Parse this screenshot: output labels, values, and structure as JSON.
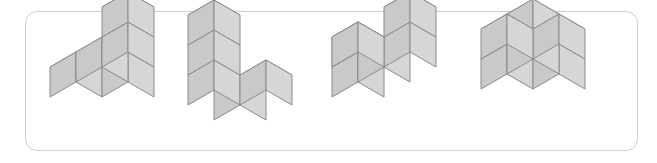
{
  "panel": {
    "border_color": "#cfcfcf",
    "background": "#ffffff",
    "corner_radius": 12,
    "width": 613,
    "height": 140
  },
  "render": {
    "cube_size": 30,
    "iso_dx": 26,
    "iso_dy": 15,
    "top_face_color": "#e2e2e2",
    "left_face_color": "#c9c9c9",
    "right_face_color": "#d6d6d6",
    "edge_color": "#8a8a8a",
    "edge_width": 1
  },
  "figures": [
    {
      "id": "figure-1",
      "label": "cube-figure-1",
      "left": 30,
      "top": 0,
      "origin_x": 20,
      "origin_y": 100,
      "cubes": [
        [
          0,
          0,
          0
        ],
        [
          1,
          0,
          0
        ],
        [
          2,
          0,
          0
        ],
        [
          1,
          -1,
          0
        ],
        [
          2,
          0,
          1
        ]
      ]
    },
    {
      "id": "figure-2",
      "label": "cube-figure-2",
      "left": 168,
      "top": 0,
      "origin_x": 20,
      "origin_y": 108,
      "cubes": [
        [
          0,
          0,
          0
        ],
        [
          0,
          0,
          1
        ],
        [
          0,
          0,
          2
        ],
        [
          0,
          -1,
          0
        ],
        [
          1,
          -1,
          0
        ]
      ]
    },
    {
      "id": "figure-3",
      "label": "cube-figure-3",
      "left": 310,
      "top": 0,
      "origin_x": 22,
      "origin_y": 100,
      "cubes": [
        [
          0,
          0,
          0
        ],
        [
          1,
          0,
          0
        ],
        [
          2,
          0,
          0
        ],
        [
          1,
          1,
          0
        ],
        [
          0,
          0,
          1
        ],
        [
          2,
          0,
          1
        ]
      ]
    },
    {
      "id": "figure-4",
      "label": "cube-figure-4",
      "left": 455,
      "top": 0,
      "origin_x": 26,
      "origin_y": 92,
      "cubes": [
        [
          0,
          0,
          0
        ],
        [
          1,
          0,
          0
        ],
        [
          2,
          0,
          0
        ],
        [
          1,
          1,
          0
        ],
        [
          1,
          -1,
          0
        ],
        [
          1,
          0,
          1
        ]
      ]
    }
  ]
}
